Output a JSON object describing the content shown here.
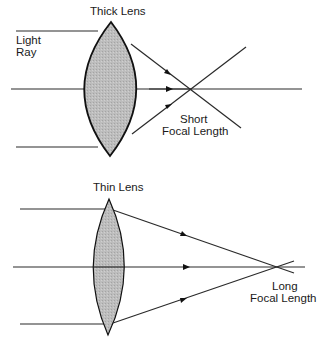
{
  "colors": {
    "background": "#ffffff",
    "line": "#2a2a2a",
    "lens_fill": "#b9b9b9",
    "lens_outline": "#111111"
  },
  "thick_lens": {
    "title": "Thick  Lens",
    "ray_label_line1": "Light",
    "ray_label_line2": "Ray",
    "focal_label_line1": "Short",
    "focal_label_line2": "Focal  Length"
  },
  "thin_lens": {
    "title": "Thin   Lens",
    "focal_label_line1": "Long",
    "focal_label_line2": "Focal  Length"
  }
}
